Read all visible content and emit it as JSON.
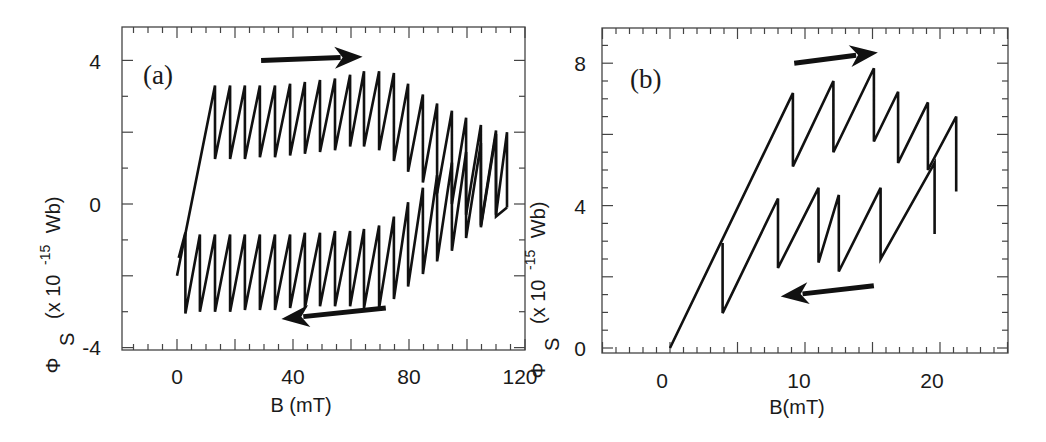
{
  "figure": {
    "panels": [
      {
        "id": "a",
        "label": "(a)",
        "xlabel": "B (mT)",
        "ylabel_symbol": "Φ",
        "ylabel_sub": "S",
        "ylabel_rest": "(x 10",
        "ylabel_exp": "-15",
        "ylabel_unit": "Wb)",
        "xticks": [
          "0",
          "40",
          "80",
          "120"
        ],
        "yticks": [
          "4",
          "0",
          "-4"
        ]
      },
      {
        "id": "b",
        "label": "(b)",
        "xlabel": "B(mT)",
        "ylabel_symbol": "Φ",
        "ylabel_sub": "S",
        "ylabel_rest": "(x 10",
        "ylabel_exp": "-15",
        "ylabel_unit": "Wb)",
        "xticks": [
          "0",
          "10",
          "20"
        ],
        "yticks": [
          "8",
          "4",
          "0"
        ]
      }
    ]
  },
  "chart_data": [
    {
      "type": "line",
      "title": "(a)",
      "xlabel": "B (mT)",
      "ylabel": "Φ_S (x 10^-15 Wb)",
      "xlim": [
        -20,
        120
      ],
      "ylim": [
        -4.1,
        4.9
      ],
      "xticks": [
        0,
        40,
        80,
        120
      ],
      "xminor_step": 5,
      "yticks": [
        -4,
        0,
        4
      ],
      "yminor_step": 1,
      "grid": false,
      "legend": null,
      "annotations": [
        {
          "type": "arrow",
          "direction": "right",
          "meaning": "field increasing",
          "from": [
            29,
            4.0
          ],
          "to": [
            64,
            4.1
          ]
        },
        {
          "type": "arrow",
          "direction": "left",
          "meaning": "field decreasing",
          "from": [
            72,
            -2.9
          ],
          "to": [
            36,
            -3.2
          ]
        }
      ],
      "series": [
        {
          "name": "sweep up",
          "points": [
            [
              0,
              -2.0
            ],
            [
              13.1,
              3.3
            ],
            [
              13.1,
              1.25
            ],
            [
              18.3,
              3.3
            ],
            [
              18.3,
              1.25
            ],
            [
              23.4,
              3.3
            ],
            [
              23.4,
              1.25
            ],
            [
              28.6,
              3.3
            ],
            [
              28.6,
              1.3
            ],
            [
              33.8,
              3.3
            ],
            [
              33.8,
              1.3
            ],
            [
              39.0,
              3.35
            ],
            [
              39.0,
              1.35
            ],
            [
              44.1,
              3.4
            ],
            [
              44.1,
              1.4
            ],
            [
              49.3,
              3.45
            ],
            [
              49.3,
              1.45
            ],
            [
              54.5,
              3.5
            ],
            [
              54.5,
              1.5
            ],
            [
              59.7,
              3.6
            ],
            [
              59.7,
              1.6
            ],
            [
              64.5,
              3.7
            ],
            [
              64.5,
              1.6
            ],
            [
              69.7,
              3.7
            ],
            [
              69.7,
              1.5
            ],
            [
              74.8,
              3.65
            ],
            [
              74.8,
              1.2
            ],
            [
              79.7,
              3.35
            ],
            [
              79.7,
              0.9
            ],
            [
              84.8,
              3.05
            ],
            [
              84.8,
              0.6
            ],
            [
              89.7,
              2.8
            ],
            [
              89.7,
              0.3
            ],
            [
              94.8,
              2.6
            ],
            [
              94.8,
              0.0
            ],
            [
              99.7,
              2.4
            ],
            [
              99.7,
              -0.3
            ],
            [
              104.8,
              2.2
            ],
            [
              104.8,
              -0.6
            ],
            [
              110.0,
              2.05
            ],
            [
              110.0,
              -0.3
            ],
            [
              113.8,
              2.0
            ],
            [
              113.8,
              -0.1
            ]
          ]
        },
        {
          "name": "sweep down",
          "points": [
            [
              113.8,
              -0.1
            ],
            [
              110.0,
              -0.35
            ],
            [
              110.0,
              1.95
            ],
            [
              104.8,
              -0.65
            ],
            [
              104.8,
              1.7
            ],
            [
              99.7,
              -0.95
            ],
            [
              99.7,
              1.45
            ],
            [
              94.8,
              -1.3
            ],
            [
              94.8,
              1.15
            ],
            [
              89.7,
              -1.6
            ],
            [
              89.7,
              0.8
            ],
            [
              84.8,
              -1.95
            ],
            [
              84.8,
              0.45
            ],
            [
              79.7,
              -2.3
            ],
            [
              79.7,
              0.05
            ],
            [
              74.8,
              -2.65
            ],
            [
              74.8,
              -0.35
            ],
            [
              69.7,
              -2.9
            ],
            [
              69.7,
              -0.6
            ],
            [
              64.5,
              -2.9
            ],
            [
              64.5,
              -0.7
            ],
            [
              59.7,
              -2.85
            ],
            [
              59.7,
              -0.75
            ],
            [
              54.5,
              -2.85
            ],
            [
              54.5,
              -0.75
            ],
            [
              49.3,
              -2.85
            ],
            [
              49.3,
              -0.8
            ],
            [
              44.1,
              -2.9
            ],
            [
              44.1,
              -0.8
            ],
            [
              39.0,
              -2.9
            ],
            [
              39.0,
              -0.85
            ],
            [
              33.8,
              -2.95
            ],
            [
              33.8,
              -0.85
            ],
            [
              28.6,
              -2.95
            ],
            [
              28.6,
              -0.85
            ],
            [
              23.4,
              -2.95
            ],
            [
              23.4,
              -0.85
            ],
            [
              18.3,
              -3.0
            ],
            [
              18.3,
              -0.85
            ],
            [
              13.1,
              -3.0
            ],
            [
              13.1,
              -0.85
            ],
            [
              7.9,
              -3.0
            ],
            [
              7.9,
              -0.85
            ],
            [
              2.9,
              -3.05
            ],
            [
              2.9,
              -0.8
            ],
            [
              0.6,
              -1.5
            ]
          ]
        }
      ]
    },
    {
      "type": "line",
      "title": "(b)",
      "xlabel": "B(mT)",
      "ylabel": "Φ_S (x 10^-15 Wb)",
      "xlim": [
        -5,
        25
      ],
      "ylim": [
        -0.1,
        8.9
      ],
      "xticks": [
        0,
        10,
        20
      ],
      "xmajor_marks_step": 5,
      "xminor_step": 1,
      "yticks": [
        0,
        4,
        8
      ],
      "ymajor_marks_step": 2,
      "yminor_step": 0.5,
      "grid": false,
      "legend": null,
      "annotations": [
        {
          "type": "arrow",
          "direction": "right",
          "meaning": "field increasing",
          "from": [
            9.2,
            8.0
          ],
          "to": [
            15.4,
            8.3
          ]
        },
        {
          "type": "arrow",
          "direction": "left",
          "meaning": "field decreasing",
          "from": [
            15.1,
            1.75
          ],
          "to": [
            8.2,
            1.45
          ]
        }
      ],
      "series": [
        {
          "name": "sweep up",
          "points": [
            [
              0,
              0
            ],
            [
              9.1,
              7.16
            ],
            [
              9.1,
              5.1
            ],
            [
              12.1,
              7.5
            ],
            [
              12.1,
              5.5
            ],
            [
              15.1,
              7.86
            ],
            [
              15.1,
              5.8
            ],
            [
              16.9,
              7.2
            ],
            [
              16.9,
              5.2
            ],
            [
              19.1,
              6.9
            ],
            [
              19.1,
              5.0
            ],
            [
              21.2,
              6.5
            ],
            [
              21.2,
              4.4
            ]
          ]
        },
        {
          "name": "sweep down",
          "points": [
            [
              19.6,
              3.2
            ],
            [
              19.6,
              5.2
            ],
            [
              15.6,
              2.5
            ],
            [
              15.6,
              4.5
            ],
            [
              12.5,
              2.15
            ],
            [
              12.5,
              4.3
            ],
            [
              11.0,
              2.4
            ],
            [
              11.0,
              4.5
            ],
            [
              8.0,
              2.25
            ],
            [
              8.0,
              4.2
            ],
            [
              3.9,
              0.98
            ],
            [
              3.9,
              2.95
            ]
          ]
        }
      ]
    }
  ]
}
